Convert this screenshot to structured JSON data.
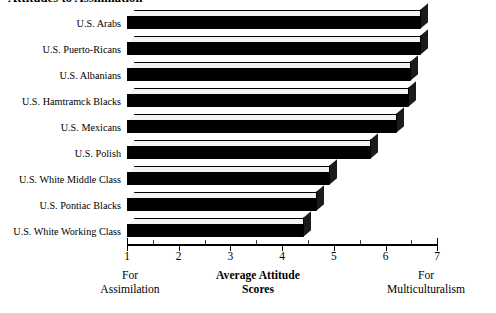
{
  "chart_data": {
    "type": "bar",
    "orientation": "horizontal",
    "title": "Attitudes to Assimilation",
    "categories": [
      "U.S. Arabs",
      "U.S. Puerto-Ricans",
      "U.S. Albanians",
      "U.S. Hamtramck Blacks",
      "U.S. Mexicans",
      "U.S. Polish",
      "U.S. White Middle Class",
      "U.S. Pontiac Blacks",
      "U.S. White Working Class"
    ],
    "values": [
      6.67,
      6.67,
      6.48,
      6.44,
      6.2,
      5.7,
      4.9,
      4.65,
      4.4
    ],
    "xlabel": "Average Attitude Scores",
    "ylabel": "",
    "xlim": [
      1,
      7
    ],
    "x_ticks": [
      1,
      2,
      3,
      4,
      5,
      6,
      7
    ],
    "x_tick_labels": [
      "1",
      "2",
      "3",
      "4",
      "5",
      "6",
      "7"
    ],
    "minor_ticks_per_interval": 1,
    "grid": false,
    "legend": null,
    "bar_color": "#000000",
    "bar_top_color": "#F2F2F2",
    "background": "#FFFFFF",
    "annotations": {
      "left_anchor_line1": "For",
      "left_anchor_line2": "Assimilation",
      "center_line1": "Average Attitude",
      "center_line2": "Scores",
      "right_anchor_line1": "For",
      "right_anchor_line2": "Multiculturalism"
    }
  },
  "axis": {
    "x_labels": [
      "1",
      "2",
      "3",
      "4",
      "5",
      "6",
      "7"
    ]
  }
}
